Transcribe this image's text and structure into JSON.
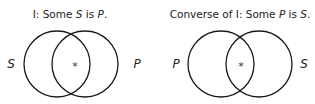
{
  "diagrams": [
    {
      "title_prefix": "I:  Some ",
      "title_subject": "S",
      "title_mid": " is ",
      "title_predicate": "P",
      "title_suffix": ".",
      "left_label": "S",
      "right_label": "P",
      "marker": "*"
    },
    {
      "title_prefix": "Converse of I:  Some ",
      "title_subject": "P",
      "title_mid": " is ",
      "title_predicate": "S",
      "title_suffix": ".",
      "left_label": "P",
      "right_label": "S",
      "marker": "*"
    }
  ]
}
